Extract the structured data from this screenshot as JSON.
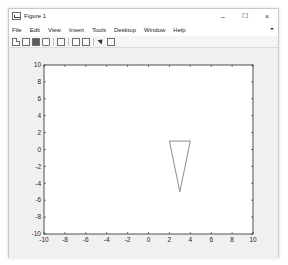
{
  "window": {
    "title": "Figure 1",
    "controls": {
      "minimize": "–",
      "maximize": "☐",
      "close": "×"
    }
  },
  "menubar": {
    "items": [
      "File",
      "Edit",
      "View",
      "Insert",
      "Tools",
      "Desktop",
      "Window",
      "Help"
    ]
  },
  "toolbar": {
    "icons": [
      "new-figure-icon",
      "open-file-icon",
      "save-icon",
      "print-icon",
      "print-preview-icon",
      "link-plot-icon",
      "insert-colorbar-icon",
      "edit-plot-arrow-icon",
      "insert-legend-icon"
    ]
  },
  "axes_toolbar": {
    "icons": [
      "brush-icon",
      "data-tip-icon",
      "restore-view-icon",
      "pan-icon",
      "zoom-in-icon",
      "zoom-out-icon",
      "home-icon"
    ]
  },
  "chart_data": {
    "type": "line",
    "title": "",
    "xlabel": "",
    "ylabel": "",
    "xlim": [
      -10,
      10
    ],
    "ylim": [
      -10,
      10
    ],
    "grid": false,
    "x_ticks": [
      -10,
      -8,
      -6,
      -4,
      -2,
      0,
      2,
      4,
      6,
      8,
      10
    ],
    "y_ticks": [
      -10,
      -8,
      -6,
      -4,
      -2,
      0,
      2,
      4,
      6,
      8,
      10
    ],
    "series": [
      {
        "name": "triangle",
        "x": [
          2,
          4,
          3,
          2
        ],
        "y": [
          1,
          1,
          -5,
          1
        ],
        "color": "#8c8c8c"
      }
    ]
  }
}
